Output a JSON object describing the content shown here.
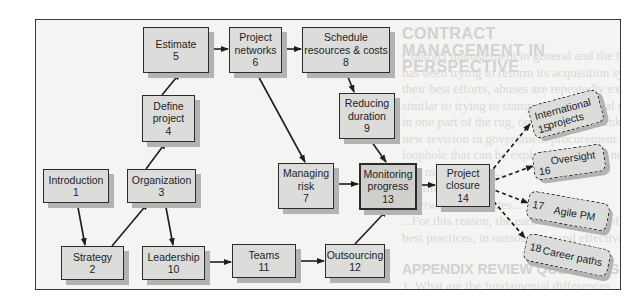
{
  "diagram": {
    "type": "flowchart",
    "nodes": [
      {
        "id": 1,
        "label": "Introduction",
        "num": "1"
      },
      {
        "id": 2,
        "label": "Strategy",
        "num": "2"
      },
      {
        "id": 3,
        "label": "Organization",
        "num": "3"
      },
      {
        "id": 4,
        "label": "Define\nproject",
        "num": "4"
      },
      {
        "id": 5,
        "label": "Estimate",
        "num": "5"
      },
      {
        "id": 6,
        "label": "Project\nnetworks",
        "num": "6"
      },
      {
        "id": 7,
        "label": "Managing\nrisk",
        "num": "7"
      },
      {
        "id": 8,
        "label": "Schedule\nresources & costs",
        "num": "8"
      },
      {
        "id": 9,
        "label": "Reducing\nduration",
        "num": "9"
      },
      {
        "id": 10,
        "label": "Leadership",
        "num": "10"
      },
      {
        "id": 11,
        "label": "Teams",
        "num": "11"
      },
      {
        "id": 12,
        "label": "Outsourcing",
        "num": "12"
      },
      {
        "id": 13,
        "label": "Monitoring\nprogress",
        "num": "13"
      },
      {
        "id": 14,
        "label": "Project\nclosure",
        "num": "14"
      }
    ],
    "optional_nodes": [
      {
        "id": 15,
        "label": "International\nprojects",
        "num": "15"
      },
      {
        "id": 16,
        "label": "Oversight",
        "num": "16"
      },
      {
        "id": 17,
        "label": "Agile PM",
        "num": "17"
      },
      {
        "id": 18,
        "label": "Career paths",
        "num": "18"
      }
    ],
    "edges": [
      {
        "from": 1,
        "to": 2,
        "style": "solid"
      },
      {
        "from": 2,
        "to": 3,
        "style": "solid"
      },
      {
        "from": 3,
        "to": 4,
        "style": "solid"
      },
      {
        "from": 3,
        "to": 10,
        "style": "solid"
      },
      {
        "from": 4,
        "to": 5,
        "style": "solid"
      },
      {
        "from": 5,
        "to": 6,
        "style": "solid"
      },
      {
        "from": 6,
        "to": 8,
        "style": "solid"
      },
      {
        "from": 6,
        "to": 7,
        "style": "solid"
      },
      {
        "from": 8,
        "to": 9,
        "style": "solid"
      },
      {
        "from": 9,
        "to": 13,
        "style": "solid"
      },
      {
        "from": 7,
        "to": 13,
        "style": "solid"
      },
      {
        "from": 10,
        "to": 11,
        "style": "solid"
      },
      {
        "from": 11,
        "to": 12,
        "style": "solid"
      },
      {
        "from": 12,
        "to": 13,
        "style": "solid"
      },
      {
        "from": 13,
        "to": 14,
        "style": "solid"
      },
      {
        "from": 14,
        "to": 15,
        "style": "dashed"
      },
      {
        "from": 14,
        "to": 16,
        "style": "dashed"
      },
      {
        "from": 14,
        "to": 17,
        "style": "dashed"
      },
      {
        "from": 14,
        "to": 18,
        "style": "dashed"
      }
    ],
    "highlighted_node": 13
  },
  "bleed_through": {
    "heading": "CONTRACT MANAGEMENT IN PERSPECTIVE",
    "para": "Contract management in general and the federal government\nhas been trying to reform its acquisition system. Despite\ntheir best efforts, abuses are repeatedly exposed in the news media. The situation is\nsimilar to trying to stamp out an Oriental rug to eliminate a wrinkle\nin one part of the rug, only to find a wrinkle elsewhere. Likewise, each\nnew revision in government procurement procedures seems to generate a new\nloophole that can be exploited. There is no perfect contract management system\n...in most projects...\n...estimates...\n...between the parties...\n...For this reason, the earlier discussion of\nbest practices, in outsourcing and effective negotiating is very important.",
    "heading2": "APPENDIX REVIEW QUESTIONS",
    "foot": "1. What are the fundamental differences between fixed-price and cost-plus"
  }
}
